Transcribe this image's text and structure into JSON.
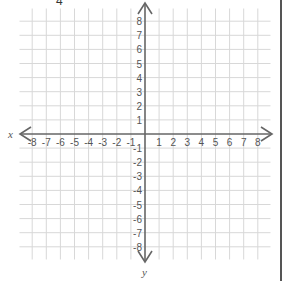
{
  "figure": {
    "type": "coordinate-plane",
    "cut_label": "4",
    "x_axis_label": "x",
    "y_axis_label": "y",
    "x_range": [
      -8,
      8
    ],
    "y_range": [
      -8,
      8
    ],
    "x_ticks": [
      "-8",
      "-7",
      "-6",
      "-5",
      "-4",
      "-3",
      "-2",
      "-1",
      "1",
      "2",
      "3",
      "4",
      "5",
      "6",
      "7",
      "8"
    ],
    "y_ticks": [
      "8",
      "7",
      "6",
      "5",
      "4",
      "3",
      "2",
      "1",
      "-1",
      "-2",
      "-3",
      "-4",
      "-5",
      "-6",
      "-7",
      "-8"
    ],
    "colors": {
      "grid": "#d8d8d8",
      "axis": "#666666",
      "label": "#555555",
      "border": "#555555"
    }
  }
}
